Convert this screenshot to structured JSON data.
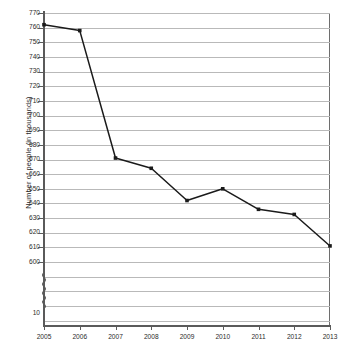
{
  "chart_data": {
    "type": "line",
    "title": "",
    "xlabel": "",
    "ylabel": "Number of people (in thousands)",
    "categories": [
      "2005",
      "2006",
      "2007",
      "2008",
      "2009",
      "2010",
      "2011",
      "2012",
      "2013"
    ],
    "x": [
      2005,
      2006,
      2007,
      2008,
      2009,
      2010,
      2011,
      2012,
      2013
    ],
    "values": [
      762,
      758,
      671,
      664,
      642,
      650,
      636,
      632.5,
      611
    ],
    "series": [
      {
        "name": "Number of people",
        "values": [
          762,
          758,
          671,
          664,
          642,
          650,
          636,
          632.5,
          611
        ]
      }
    ],
    "ylim": [
      600,
      770
    ],
    "y_ticks": [
      770,
      760,
      750,
      740,
      730,
      720,
      710,
      700,
      690,
      680,
      670,
      660,
      650,
      640,
      630,
      620,
      610,
      600
    ],
    "y_tick_labels": [
      "770",
      "760",
      "750",
      "740",
      "730",
      "720",
      "710",
      "700",
      "690",
      "680",
      "670",
      "660",
      "650",
      "640",
      "630",
      "620",
      "610",
      "600"
    ],
    "y_break_label": "10",
    "axis_break": true,
    "grid": true,
    "legend": "none",
    "marker": "square",
    "line_color": "#1a1a1a",
    "grid_color": "#b9b9b9",
    "axis_color": "#5a5a5a",
    "background_color": "#ffffff"
  },
  "axis": {
    "y_title": "Number of people (in thousands)"
  }
}
